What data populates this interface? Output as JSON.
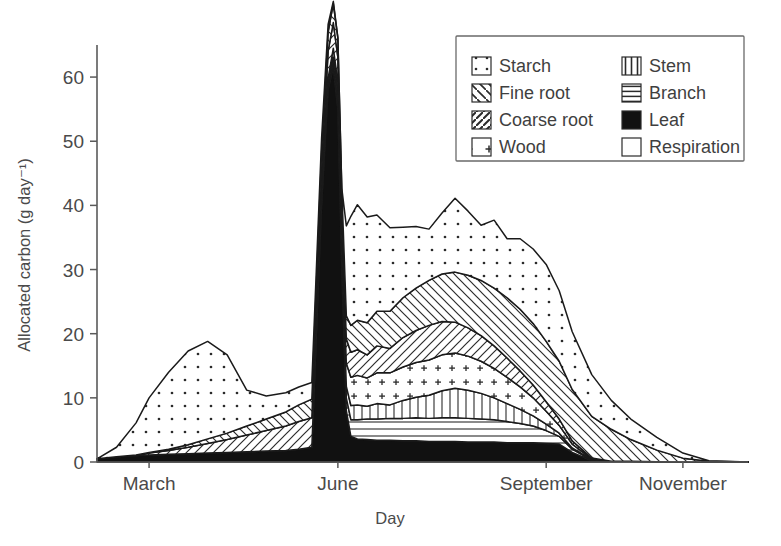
{
  "chart_data": {
    "type": "area",
    "title": "",
    "xlabel": "Day",
    "ylabel": "Allocated carbon (g day⁻¹)",
    "stacked": true,
    "grid": false,
    "legend_position": "top-right",
    "ylim": [
      0,
      65
    ],
    "yticks": [
      0,
      10,
      20,
      30,
      40,
      50,
      60
    ],
    "ytick_labels": [
      "0",
      "10",
      "20",
      "30",
      "40",
      "50",
      "60"
    ],
    "xlim": [
      0,
      100
    ],
    "xticks": [
      8,
      37,
      69,
      90
    ],
    "xtick_labels": [
      "March",
      "June",
      "September",
      "November"
    ],
    "x": [
      0,
      3,
      6,
      8,
      11,
      14,
      17,
      20,
      23,
      26,
      29,
      31,
      33,
      34.5,
      35.5,
      36.3,
      37,
      37.6,
      38.3,
      39,
      40,
      41.5,
      43,
      45,
      47,
      49,
      51,
      53,
      55,
      57,
      59,
      61,
      63,
      65,
      67,
      69,
      71,
      73,
      76,
      79,
      82,
      86,
      90,
      94,
      100
    ],
    "series": [
      {
        "name": "Leaf",
        "pattern": "solid-black",
        "values": [
          0.5,
          0.8,
          1.0,
          1.1,
          1.2,
          1.3,
          1.4,
          1.5,
          1.6,
          1.7,
          1.8,
          2.0,
          2.3,
          40.0,
          58.0,
          61.5,
          55.0,
          30.0,
          8.0,
          4.0,
          3.6,
          3.5,
          3.4,
          3.4,
          3.3,
          3.3,
          3.2,
          3.2,
          3.2,
          3.1,
          3.1,
          3.1,
          3.0,
          3.0,
          3.0,
          2.9,
          2.8,
          1.5,
          0.2,
          0.1,
          0.1,
          0.05,
          0,
          0,
          0
        ]
      },
      {
        "name": "Branch",
        "pattern": "horizontal-lines",
        "values": [
          0,
          0,
          0,
          0,
          0,
          0,
          0,
          0,
          0,
          0,
          0,
          0,
          0,
          0.3,
          0.6,
          0.9,
          1.2,
          1.5,
          2.0,
          2.6,
          3.0,
          3.2,
          3.3,
          3.4,
          3.5,
          3.6,
          3.6,
          3.7,
          3.7,
          3.7,
          3.6,
          3.5,
          3.3,
          3.0,
          2.6,
          2.0,
          1.2,
          0.5,
          0.1,
          0,
          0,
          0,
          0,
          0,
          0
        ]
      },
      {
        "name": "Stem",
        "pattern": "vertical-lines",
        "values": [
          0,
          0,
          0,
          0,
          0,
          0,
          0,
          0,
          0,
          0,
          0,
          0,
          0,
          0.2,
          0.4,
          0.7,
          1.0,
          1.4,
          1.8,
          2.2,
          2.3,
          2.0,
          2.4,
          2.1,
          2.8,
          3.2,
          3.6,
          4.2,
          4.6,
          4.4,
          4.0,
          3.4,
          2.8,
          2.2,
          1.6,
          1.0,
          0.5,
          0.2,
          0.05,
          0,
          0,
          0,
          0,
          0,
          0
        ]
      },
      {
        "name": "Wood",
        "pattern": "plus-signs",
        "values": [
          0,
          0,
          0,
          0,
          0,
          0,
          0,
          0,
          0,
          0,
          0,
          0,
          0,
          0.4,
          0.8,
          1.4,
          2.0,
          2.8,
          3.6,
          4.4,
          4.6,
          4.4,
          4.8,
          5.0,
          5.2,
          5.4,
          5.5,
          5.6,
          5.5,
          5.3,
          5.0,
          4.6,
          4.1,
          3.5,
          2.8,
          2.0,
          1.2,
          0.6,
          0.15,
          0,
          0,
          0,
          0,
          0,
          0
        ]
      },
      {
        "name": "Coarse root",
        "pattern": "diagonal-forward",
        "values": [
          0,
          0,
          0.1,
          0.3,
          0.6,
          1.0,
          1.5,
          2.0,
          2.6,
          3.2,
          3.8,
          4.3,
          4.6,
          4.4,
          4.2,
          4.0,
          3.9,
          3.8,
          3.8,
          3.9,
          4.0,
          3.6,
          4.2,
          3.8,
          4.6,
          5.0,
          5.4,
          5.2,
          4.8,
          4.4,
          4.0,
          3.5,
          3.0,
          2.5,
          2.0,
          1.5,
          1.0,
          0.5,
          0.12,
          0,
          0,
          0,
          0,
          0,
          0
        ]
      },
      {
        "name": "Fine root",
        "pattern": "diagonal-back",
        "values": [
          0,
          0,
          0,
          0.1,
          0.2,
          0.4,
          0.7,
          1.0,
          1.4,
          1.8,
          2.2,
          2.6,
          2.9,
          3.0,
          3.0,
          3.0,
          3.0,
          3.2,
          3.6,
          4.2,
          4.6,
          5.0,
          5.4,
          5.8,
          6.2,
          6.6,
          7.0,
          7.4,
          7.8,
          8.2,
          8.6,
          9.0,
          9.4,
          9.6,
          9.6,
          9.4,
          9.0,
          8.0,
          6.5,
          5.0,
          3.4,
          1.8,
          0.6,
          0.1,
          0
        ]
      },
      {
        "name": "Starch",
        "pattern": "dots",
        "values": [
          0,
          1.5,
          5.0,
          8.5,
          12.0,
          14.6,
          15.2,
          12.2,
          5.6,
          3.6,
          3.0,
          2.8,
          2.6,
          2.2,
          1.2,
          0.3,
          0.0,
          0.0,
          14.0,
          17.0,
          18.0,
          16.5,
          15.0,
          13.0,
          11.0,
          9.6,
          8.0,
          9.5,
          11.5,
          10.0,
          8.6,
          10.6,
          9.2,
          11.0,
          11.6,
          12.0,
          11.0,
          9.0,
          6.5,
          4.5,
          3.2,
          2.0,
          0.8,
          0.1,
          0
        ]
      }
    ],
    "legend_entries": [
      {
        "label": "Starch",
        "pattern": "dots"
      },
      {
        "label": "Stem",
        "pattern": "vertical-lines"
      },
      {
        "label": "Fine root",
        "pattern": "diagonal-back"
      },
      {
        "label": "Branch",
        "pattern": "horizontal-lines"
      },
      {
        "label": "Coarse root",
        "pattern": "diagonal-forward"
      },
      {
        "label": "Leaf",
        "pattern": "solid-black"
      },
      {
        "label": "Wood",
        "pattern": "plus-signs"
      },
      {
        "label": "Respiration",
        "pattern": "empty"
      }
    ]
  }
}
